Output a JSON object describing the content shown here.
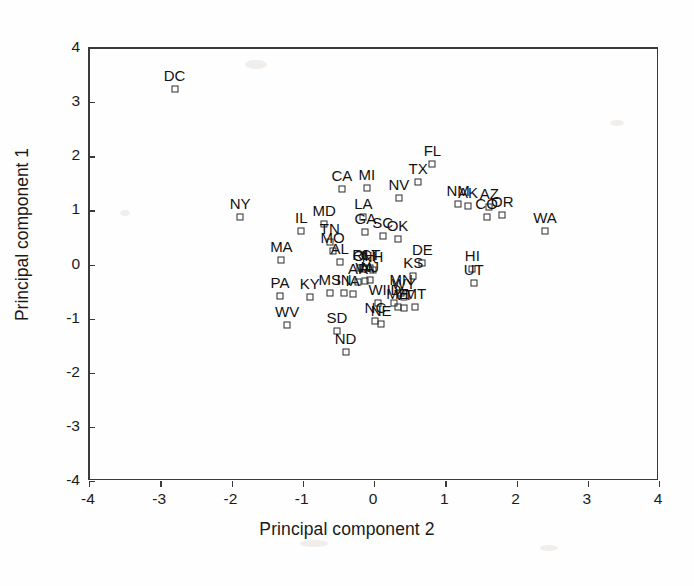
{
  "figure": {
    "xlabel": "Principal component 2",
    "ylabel": "Principal component 1"
  },
  "chart_data": {
    "type": "scatter",
    "title": "",
    "xlabel": "Principal component 2",
    "ylabel": "Principal component 1",
    "xlim": [
      -4,
      4
    ],
    "ylim": [
      -4,
      4
    ],
    "xticks": [
      "-4",
      "-3",
      "-2",
      "-1",
      "0",
      "1",
      "2",
      "3",
      "4"
    ],
    "yticks": [
      "-4",
      "-3",
      "-2",
      "-1",
      "0",
      "1",
      "2",
      "3",
      "4"
    ],
    "xtick_values": [
      -4,
      -3,
      -2,
      -1,
      0,
      1,
      2,
      3,
      4
    ],
    "ytick_values": [
      -4,
      -3,
      -2,
      -1,
      0,
      1,
      2,
      3,
      4
    ],
    "grid": false,
    "legend": null,
    "marker": "open-square",
    "point_label_position": "above",
    "points": [
      {
        "label": "DC",
        "x": -2.8,
        "y": 3.25
      },
      {
        "label": "NY",
        "x": -1.88,
        "y": 0.88
      },
      {
        "label": "CA",
        "x": -0.45,
        "y": 1.4
      },
      {
        "label": "MI",
        "x": -0.1,
        "y": 1.42
      },
      {
        "label": "FL",
        "x": 0.82,
        "y": 1.85
      },
      {
        "label": "TX",
        "x": 0.62,
        "y": 1.52
      },
      {
        "label": "NV",
        "x": 0.35,
        "y": 1.22
      },
      {
        "label": "NM",
        "x": 1.18,
        "y": 1.12
      },
      {
        "label": "AK",
        "x": 1.32,
        "y": 1.08
      },
      {
        "label": "AZ",
        "x": 1.62,
        "y": 1.06
      },
      {
        "label": "CO",
        "x": 1.58,
        "y": 0.88
      },
      {
        "label": "OR",
        "x": 1.8,
        "y": 0.92
      },
      {
        "label": "WA",
        "x": 2.4,
        "y": 0.62
      },
      {
        "label": "MD",
        "x": -0.7,
        "y": 0.75
      },
      {
        "label": "LA",
        "x": -0.15,
        "y": 0.88
      },
      {
        "label": "GA",
        "x": -0.12,
        "y": 0.6
      },
      {
        "label": "IL",
        "x": -1.02,
        "y": 0.62
      },
      {
        "label": "SC",
        "x": 0.12,
        "y": 0.52
      },
      {
        "label": "OK",
        "x": 0.33,
        "y": 0.48
      },
      {
        "label": "TN",
        "x": -0.62,
        "y": 0.42
      },
      {
        "label": "MO",
        "x": -0.58,
        "y": 0.25
      },
      {
        "label": "MA",
        "x": -1.3,
        "y": 0.08
      },
      {
        "label": "AL",
        "x": -0.48,
        "y": 0.05
      },
      {
        "label": "DE",
        "x": 0.68,
        "y": 0.03
      },
      {
        "label": "HI",
        "x": 1.38,
        "y": -0.08
      },
      {
        "label": "KS",
        "x": 0.55,
        "y": -0.22
      },
      {
        "label": "UT",
        "x": 1.4,
        "y": -0.35
      },
      {
        "label": "RI",
        "x": -0.2,
        "y": -0.07
      },
      {
        "label": "OH",
        "x": -0.14,
        "y": -0.09
      },
      {
        "label": "CT",
        "x": -0.05,
        "y": -0.06
      },
      {
        "label": "NH",
        "x": -0.02,
        "y": -0.1
      },
      {
        "label": "AR",
        "x": -0.22,
        "y": -0.32
      },
      {
        "label": "VA",
        "x": -0.13,
        "y": -0.3
      },
      {
        "label": "NJ",
        "x": -0.06,
        "y": -0.28
      },
      {
        "label": "MS",
        "x": -0.62,
        "y": -0.52
      },
      {
        "label": "IN",
        "x": -0.42,
        "y": -0.52
      },
      {
        "label": "IA",
        "x": -0.3,
        "y": -0.54
      },
      {
        "label": "PA",
        "x": -1.32,
        "y": -0.58
      },
      {
        "label": "KY",
        "x": -0.9,
        "y": -0.6
      },
      {
        "label": "MN",
        "x": 0.38,
        "y": -0.52
      },
      {
        "label": "WY",
        "x": 0.42,
        "y": -0.6
      },
      {
        "label": "WI",
        "x": 0.05,
        "y": -0.72
      },
      {
        "label": "ID",
        "x": 0.28,
        "y": -0.72
      },
      {
        "label": "SD",
        "x": -0.52,
        "y": -1.22
      },
      {
        "label": "ND",
        "x": -0.4,
        "y": -1.62
      },
      {
        "label": "ME",
        "x": 0.33,
        "y": -0.78
      },
      {
        "label": "VT",
        "x": 0.42,
        "y": -0.8
      },
      {
        "label": "MT",
        "x": 0.58,
        "y": -0.78
      },
      {
        "label": "NC",
        "x": 0.02,
        "y": -1.05
      },
      {
        "label": "NE",
        "x": 0.1,
        "y": -1.1
      },
      {
        "label": "WV",
        "x": -1.22,
        "y": -1.12
      }
    ]
  }
}
